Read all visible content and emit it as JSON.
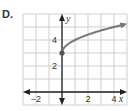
{
  "problem_label": "D.",
  "chart_data": {
    "type": "line",
    "title": "",
    "xlabel": "x",
    "ylabel": "y",
    "xlim": [
      -3,
      5
    ],
    "ylim": [
      -1,
      6
    ],
    "grid": true,
    "x_tick_labels": [
      "−2",
      "2",
      "4"
    ],
    "x_ticks": [
      -2,
      2,
      4
    ],
    "y_tick_labels": [
      "2",
      "4"
    ],
    "y_ticks": [
      2,
      4
    ],
    "series": [
      {
        "name": "y = √x + 3",
        "x": [
          0,
          0.25,
          1,
          2,
          3,
          4,
          4.8
        ],
        "y": [
          3,
          3.5,
          4,
          4.41,
          4.73,
          5,
          5.19
        ],
        "start_point": [
          0,
          3
        ],
        "end_arrow": true,
        "color": "#777777"
      }
    ]
  }
}
